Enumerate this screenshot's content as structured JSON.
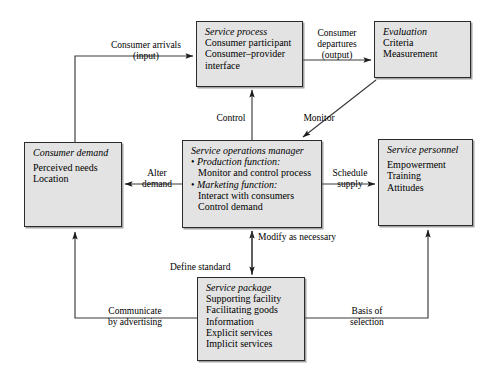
{
  "diagram": {
    "accent_fill": "#e3e3e3",
    "stroke": "#2b2b2b"
  },
  "nodes": {
    "service_process": {
      "title": "Service process",
      "lines": [
        "Consumer participant",
        "Consumer–provider",
        "interface"
      ]
    },
    "evaluation": {
      "title": "Evaluation",
      "lines": [
        "Criteria",
        "Measurement"
      ]
    },
    "consumer_demand": {
      "title": "Consumer demand",
      "lines": [
        "Perceived needs",
        "Location"
      ]
    },
    "manager": {
      "title": "Service operations manager",
      "bullet1": "Production function:",
      "bullet1_sub": "Monitor and control process",
      "bullet2": "Marketing function:",
      "bullet2_sub1": "Interact with consumers",
      "bullet2_sub2": "Control demand"
    },
    "service_personnel": {
      "title": "Service personnel",
      "lines": [
        "Empowerment",
        "Training",
        "Attitudes"
      ]
    },
    "service_package": {
      "title": "Service package",
      "lines": [
        "Supporting facility",
        "Facilitating goods",
        "Information",
        "Explicit services",
        "Implicit services"
      ]
    }
  },
  "edges": {
    "consumer_arrivals": {
      "line1": "Consumer arrivals",
      "line2": "(input)"
    },
    "consumer_departures": {
      "line1": "Consumer",
      "line2": "departures",
      "line3": "(output)"
    },
    "control": {
      "line1": "Control"
    },
    "monitor": {
      "line1": "Monitor"
    },
    "alter_demand": {
      "line1": "Alter",
      "line2": "demand"
    },
    "schedule_supply": {
      "line1": "Schedule",
      "line2": "supply"
    },
    "modify_as_necessary": {
      "line1": "Modify as necessary"
    },
    "define_standard": {
      "line1": "Define standard"
    },
    "communicate_by_advertising": {
      "line1": "Communicate",
      "line2": "by advertising"
    },
    "basis_of_selection": {
      "line1": "Basis of",
      "line2": "selection"
    }
  }
}
